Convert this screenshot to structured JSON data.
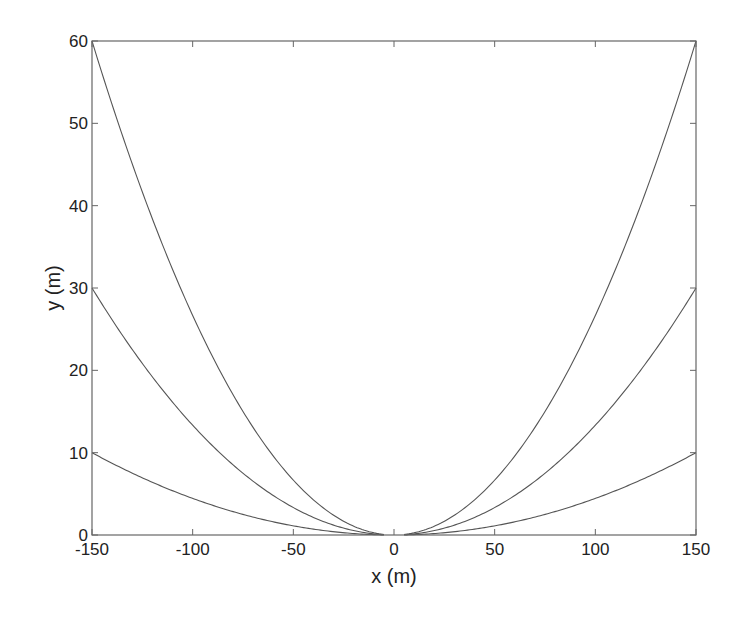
{
  "chart_data": {
    "type": "line",
    "title": "",
    "xlabel": "x (m)",
    "ylabel": "y (m)",
    "xlim": [
      -150,
      150
    ],
    "ylim": [
      0,
      60
    ],
    "grid": false,
    "legend": null,
    "xticks": [
      -150,
      -100,
      -50,
      0,
      50,
      100,
      150
    ],
    "yticks": [
      0,
      10,
      20,
      30,
      40,
      50,
      60
    ],
    "xtick_labels": [
      "-150",
      "-100",
      "-50",
      "0",
      "50",
      "100",
      "150"
    ],
    "ytick_labels": [
      "0",
      "10",
      "20",
      "30",
      "40",
      "50",
      "60"
    ],
    "series": [
      {
        "name": "curve-sag-60",
        "formula": "y = 60*(x/150)^2",
        "x": [
          -150,
          -125,
          -100,
          -75,
          -50,
          -25,
          -5,
          5,
          25,
          50,
          75,
          100,
          125,
          150
        ],
        "values": [
          60,
          41.7,
          26.7,
          15,
          6.7,
          1.7,
          0.07,
          0.07,
          1.7,
          6.7,
          15,
          26.7,
          41.7,
          60
        ]
      },
      {
        "name": "curve-sag-30",
        "formula": "y = 30*(x/150)^2",
        "x": [
          -150,
          -125,
          -100,
          -75,
          -50,
          -25,
          -5,
          5,
          25,
          50,
          75,
          100,
          125,
          150
        ],
        "values": [
          30,
          20.8,
          13.3,
          7.5,
          3.3,
          0.8,
          0.03,
          0.03,
          0.8,
          3.3,
          7.5,
          13.3,
          20.8,
          30
        ]
      },
      {
        "name": "curve-sag-10",
        "formula": "y = 10*(x/150)^2",
        "x": [
          -150,
          -125,
          -100,
          -75,
          -50,
          -25,
          -5,
          5,
          25,
          50,
          75,
          100,
          125,
          150
        ],
        "values": [
          10,
          6.9,
          4.4,
          2.5,
          1.1,
          0.3,
          0.01,
          0.01,
          0.3,
          1.1,
          2.5,
          4.4,
          6.9,
          10
        ]
      }
    ],
    "line_color": "#555555",
    "frame_color": "#666666"
  }
}
